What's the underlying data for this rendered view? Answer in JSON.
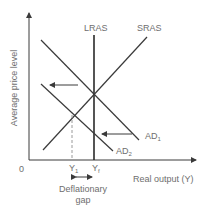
{
  "diagram": {
    "y_axis_label": "Average price level",
    "x_axis_label": "Real output (Y)",
    "origin_label": "0",
    "curves": {
      "lras": "LRAS",
      "sras": "SRAS",
      "ad1": "AD",
      "ad1_sub": "1",
      "ad2": "AD",
      "ad2_sub": "2"
    },
    "x_ticks": {
      "y1": "Y",
      "y1_sub": "1",
      "yf": "Y",
      "yf_sub": "f"
    },
    "gap_label_line1": "Deflationary",
    "gap_label_line2": "gap",
    "colors": {
      "lines": "#3a3a3a",
      "text": "#6e6e6e",
      "dashed": "#9a9a9a"
    }
  }
}
